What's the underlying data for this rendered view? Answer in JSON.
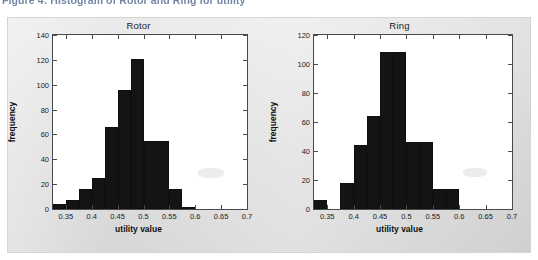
{
  "caption": {
    "text": "Figure 4: Histogram of Rotor and Ring for utility"
  },
  "figure": {
    "background_color": "#e2e2e2",
    "plot_background_color": "#ffffff",
    "bar_color": "#141414",
    "axis_color": "#4a4a4a"
  },
  "chart_data": [
    {
      "type": "bar",
      "title": "Rotor",
      "xlabel": "utility value",
      "ylabel": "frequency",
      "xlim": [
        0.325,
        0.7
      ],
      "ylim": [
        0,
        140
      ],
      "grid": false,
      "legend": null,
      "xticks": [
        0.35,
        0.4,
        0.45,
        0.5,
        0.55,
        0.6,
        0.65,
        0.7
      ],
      "xtick_labels": [
        "0.35",
        "0.4",
        "0.45",
        "0.5",
        "0.55",
        "0.6",
        "0.65",
        "0.7"
      ],
      "yticks": [
        0,
        20,
        40,
        60,
        80,
        100,
        120,
        140
      ],
      "ytick_labels": [
        "0",
        "20",
        "40",
        "60",
        "80",
        "100",
        "120",
        "140"
      ],
      "bin_edges": [
        0.325,
        0.35,
        0.375,
        0.4,
        0.425,
        0.45,
        0.475,
        0.5,
        0.55,
        0.575,
        0.6
      ],
      "values": [
        4,
        7,
        16,
        25,
        66,
        96,
        121,
        55,
        16,
        2
      ],
      "bins": [
        {
          "x0": 0.325,
          "x1": 0.35,
          "count": 4
        },
        {
          "x0": 0.35,
          "x1": 0.375,
          "count": 7
        },
        {
          "x0": 0.375,
          "x1": 0.4,
          "count": 16
        },
        {
          "x0": 0.4,
          "x1": 0.425,
          "count": 25
        },
        {
          "x0": 0.425,
          "x1": 0.45,
          "count": 66
        },
        {
          "x0": 0.45,
          "x1": 0.475,
          "count": 96
        },
        {
          "x0": 0.475,
          "x1": 0.5,
          "count": 121
        },
        {
          "x0": 0.5,
          "x1": 0.55,
          "count": 55
        },
        {
          "x0": 0.55,
          "x1": 0.575,
          "count": 16
        },
        {
          "x0": 0.575,
          "x1": 0.6,
          "count": 2
        }
      ]
    },
    {
      "type": "bar",
      "title": "Ring",
      "xlabel": "utility value",
      "ylabel": "frequency",
      "xlim": [
        0.325,
        0.7
      ],
      "ylim": [
        0,
        120
      ],
      "grid": false,
      "legend": null,
      "xticks": [
        0.35,
        0.4,
        0.45,
        0.5,
        0.55,
        0.6,
        0.65,
        0.7
      ],
      "xtick_labels": [
        "0.35",
        "0.4",
        "0.45",
        "0.5",
        "0.55",
        "0.6",
        "0.65",
        "0.7"
      ],
      "yticks": [
        0,
        20,
        40,
        60,
        80,
        100,
        120
      ],
      "ytick_labels": [
        "0",
        "20",
        "40",
        "60",
        "80",
        "100",
        "120"
      ],
      "bin_edges": [
        0.325,
        0.35,
        0.375,
        0.4,
        0.425,
        0.45,
        0.475,
        0.5,
        0.525,
        0.55,
        0.575,
        0.6
      ],
      "values": [
        6,
        0,
        18,
        18,
        44,
        64,
        108,
        108,
        46,
        46,
        14
      ],
      "bins": [
        {
          "x0": 0.325,
          "x1": 0.35,
          "count": 6
        },
        {
          "x0": 0.35,
          "x1": 0.375,
          "count": 0
        },
        {
          "x0": 0.375,
          "x1": 0.4,
          "count": 18
        },
        {
          "x0": 0.4,
          "x1": 0.425,
          "count": 44
        },
        {
          "x0": 0.425,
          "x1": 0.45,
          "count": 64
        },
        {
          "x0": 0.45,
          "x1": 0.475,
          "count": 108
        },
        {
          "x0": 0.475,
          "x1": 0.5,
          "count": 108
        },
        {
          "x0": 0.5,
          "x1": 0.525,
          "count": 46
        },
        {
          "x0": 0.525,
          "x1": 0.55,
          "count": 46
        },
        {
          "x0": 0.55,
          "x1": 0.575,
          "count": 14
        },
        {
          "x0": 0.575,
          "x1": 0.6,
          "count": 14
        }
      ]
    }
  ]
}
